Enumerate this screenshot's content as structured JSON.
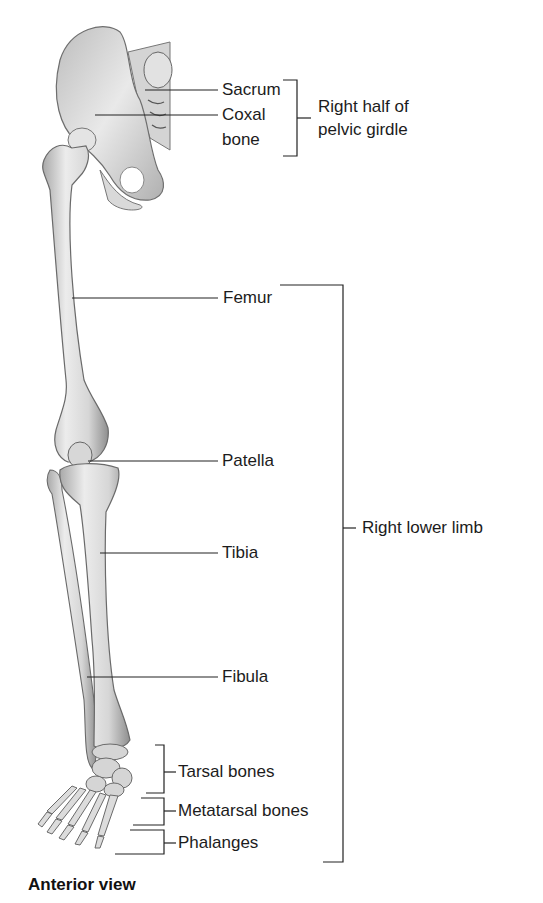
{
  "figure": {
    "view_label": "Anterior view",
    "structures": {
      "sacrum": "Sacrum",
      "coxal_bone_line1": "Coxal",
      "coxal_bone_line2": "bone",
      "femur": "Femur",
      "patella": "Patella",
      "tibia": "Tibia",
      "fibula": "Fibula",
      "tarsal": "Tarsal bones",
      "metatarsal": "Metatarsal bones",
      "phalanges": "Phalanges"
    },
    "groups": {
      "pelvic_girdle_line1": "Right half of",
      "pelvic_girdle_line2": "pelvic girdle",
      "lower_limb": "Right lower limb"
    }
  },
  "colors": {
    "bone_light": "#f1f1f1",
    "bone_mid": "#c8c8c8",
    "bone_dark": "#8a8a8a",
    "line": "#222222",
    "text": "#1c1c1c"
  }
}
